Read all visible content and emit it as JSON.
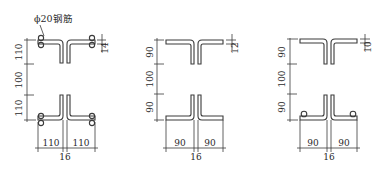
{
  "figure": {
    "callout": "ϕ20钢筋",
    "panels": [
      {
        "id": "a",
        "top_height": "110",
        "gap": "100",
        "bottom_height": "110",
        "flange_thickness": "14",
        "left_width": "110",
        "right_width": "110",
        "web_gap": "16",
        "rebar": "both-layers"
      },
      {
        "id": "b",
        "top_height": "90",
        "gap": "100",
        "bottom_height": "90",
        "flange_thickness": "12",
        "left_width": "90",
        "right_width": "90",
        "web_gap": "16",
        "rebar": "none"
      },
      {
        "id": "c",
        "top_height": "90",
        "gap": "100",
        "bottom_height": "90",
        "flange_thickness": "10",
        "left_width": "90",
        "right_width": "90",
        "web_gap": "16",
        "rebar": "bottom-only"
      }
    ]
  },
  "colors": {
    "line": "#3a3a3a",
    "background": "#ffffff"
  }
}
